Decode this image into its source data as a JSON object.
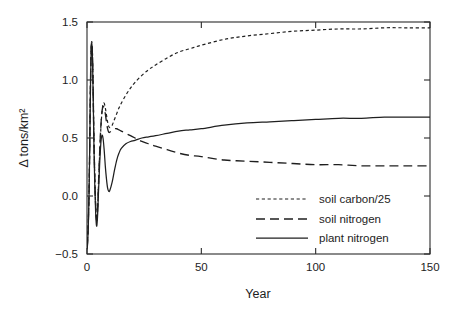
{
  "figure": {
    "background": "#ffffff",
    "ink_color": "#1f1f1f"
  },
  "chart_data": {
    "type": "line",
    "title": "",
    "xlabel": "Year",
    "ylabel": "Δ tons/km²",
    "xlim": [
      0,
      150
    ],
    "ylim": [
      -0.5,
      1.5
    ],
    "xticks": [
      0,
      50,
      100,
      150
    ],
    "xticklabels": [
      "0",
      "50",
      "100",
      "150"
    ],
    "yticks": [
      -0.5,
      0.0,
      0.5,
      1.0,
      1.5
    ],
    "yticklabels": [
      "−0.5",
      "0.0",
      "0.5",
      "1.0",
      "1.5"
    ],
    "grid": false,
    "legend_position": "lower-right-inside",
    "series": [
      {
        "name": "soil carbon/25",
        "style": "dotted",
        "legend_label": "soil carbon/25",
        "x": [
          0,
          0.3,
          0.6,
          0.9,
          1.2,
          1.5,
          1.8,
          2.1,
          2.4,
          2.7,
          3.0,
          3.4,
          3.8,
          4.2,
          4.6,
          5.0,
          5.5,
          6.0,
          6.5,
          7.0,
          7.5,
          8.0,
          8.5,
          9.0,
          9.5,
          10.0,
          11,
          12,
          13,
          14,
          15,
          17,
          19,
          21,
          24,
          27,
          30,
          35,
          40,
          45,
          50,
          60,
          70,
          80,
          90,
          100,
          110,
          120,
          130,
          140,
          150
        ],
        "y": [
          -0.43,
          -0.35,
          -0.2,
          0.05,
          0.45,
          0.95,
          1.26,
          1.33,
          1.22,
          0.92,
          0.55,
          0.18,
          -0.08,
          -0.2,
          -0.12,
          0.08,
          0.34,
          0.56,
          0.71,
          0.79,
          0.8,
          0.76,
          0.7,
          0.64,
          0.6,
          0.59,
          0.61,
          0.66,
          0.71,
          0.76,
          0.8,
          0.87,
          0.93,
          0.98,
          1.04,
          1.09,
          1.13,
          1.19,
          1.24,
          1.27,
          1.3,
          1.35,
          1.38,
          1.4,
          1.42,
          1.43,
          1.44,
          1.44,
          1.45,
          1.45,
          1.45
        ]
      },
      {
        "name": "soil nitrogen",
        "style": "dashed",
        "legend_label": "soil nitrogen",
        "x": [
          0,
          0.3,
          0.6,
          0.9,
          1.2,
          1.5,
          1.8,
          2.1,
          2.4,
          2.7,
          3.0,
          3.4,
          3.8,
          4.2,
          4.6,
          5.0,
          5.5,
          6.0,
          6.5,
          7.0,
          7.5,
          8.0,
          8.5,
          9.0,
          9.5,
          10.0,
          11,
          12,
          13,
          14,
          15,
          17,
          19,
          21,
          24,
          27,
          30,
          35,
          40,
          45,
          50,
          60,
          70,
          80,
          90,
          100,
          110,
          120,
          130,
          140,
          150
        ],
        "y": [
          -0.45,
          -0.38,
          -0.22,
          0.04,
          0.44,
          0.94,
          1.25,
          1.32,
          1.2,
          0.9,
          0.52,
          0.16,
          -0.09,
          -0.21,
          -0.13,
          0.09,
          0.36,
          0.58,
          0.72,
          0.77,
          0.76,
          0.71,
          0.64,
          0.58,
          0.55,
          0.55,
          0.57,
          0.58,
          0.58,
          0.57,
          0.56,
          0.54,
          0.52,
          0.5,
          0.47,
          0.45,
          0.43,
          0.4,
          0.37,
          0.35,
          0.34,
          0.31,
          0.3,
          0.29,
          0.28,
          0.27,
          0.27,
          0.26,
          0.26,
          0.26,
          0.26
        ]
      },
      {
        "name": "plant nitrogen",
        "style": "solid",
        "legend_label": "plant nitrogen",
        "x": [
          0,
          0.3,
          0.6,
          0.9,
          1.2,
          1.5,
          1.8,
          2.1,
          2.4,
          2.7,
          3.0,
          3.4,
          3.8,
          4.2,
          4.6,
          5.0,
          5.5,
          6.0,
          6.5,
          7.0,
          7.5,
          8.0,
          8.5,
          9.0,
          9.5,
          10.0,
          11,
          12,
          13,
          14,
          15,
          17,
          19,
          21,
          24,
          27,
          30,
          35,
          40,
          45,
          50,
          60,
          70,
          80,
          90,
          100,
          110,
          120,
          130,
          140,
          150
        ],
        "y": [
          -0.46,
          -0.4,
          -0.24,
          0.02,
          0.42,
          0.92,
          1.24,
          1.31,
          1.18,
          0.86,
          0.47,
          0.1,
          -0.15,
          -0.26,
          -0.18,
          0.02,
          0.26,
          0.44,
          0.52,
          0.5,
          0.4,
          0.26,
          0.15,
          0.07,
          0.04,
          0.05,
          0.12,
          0.22,
          0.31,
          0.37,
          0.41,
          0.45,
          0.47,
          0.48,
          0.5,
          0.51,
          0.52,
          0.54,
          0.56,
          0.57,
          0.58,
          0.61,
          0.63,
          0.64,
          0.65,
          0.66,
          0.67,
          0.67,
          0.68,
          0.68,
          0.68
        ]
      }
    ]
  }
}
